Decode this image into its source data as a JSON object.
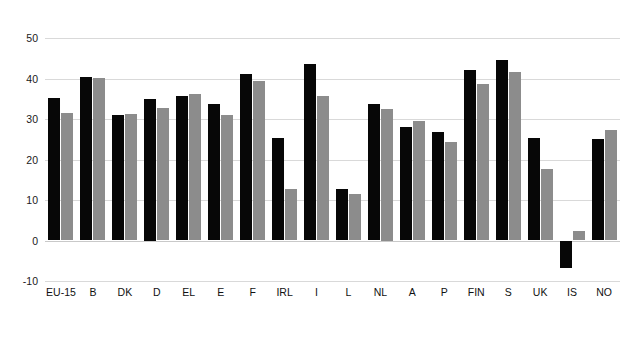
{
  "chart_data": {
    "type": "bar",
    "title": "",
    "subtitle": "",
    "xlabel": "",
    "ylabel": "",
    "ylim": [
      -10,
      50
    ],
    "yticks": [
      50,
      40,
      30,
      20,
      10,
      0,
      -10
    ],
    "grid": true,
    "legend_position": "none",
    "categories": [
      "EU-15",
      "B",
      "DK",
      "D",
      "EL",
      "E",
      "F",
      "IRL",
      "I",
      "L",
      "NL",
      "A",
      "P",
      "FIN",
      "S",
      "UK",
      "IS",
      "NO"
    ],
    "series": [
      {
        "name": "series-1",
        "color": "#070707",
        "values": [
          35.3,
          40.3,
          31.1,
          35.0,
          35.8,
          33.6,
          41.0,
          25.4,
          43.7,
          12.8,
          33.6,
          28.1,
          26.7,
          42.0,
          44.6,
          25.3,
          -6.8,
          25.1
        ]
      },
      {
        "name": "series-2",
        "color": "#8c8c8c",
        "values": [
          31.5,
          40.2,
          31.3,
          32.7,
          36.1,
          31.0,
          39.5,
          12.6,
          35.7,
          11.6,
          32.5,
          29.5,
          24.3,
          38.7,
          41.5,
          17.7,
          2.4,
          27.3
        ]
      }
    ]
  },
  "colors": {
    "series_1": "#070707",
    "series_2": "#8c8c8c",
    "gridline": "#d9d9d9",
    "background": "#ffffff",
    "text": "#111111"
  }
}
